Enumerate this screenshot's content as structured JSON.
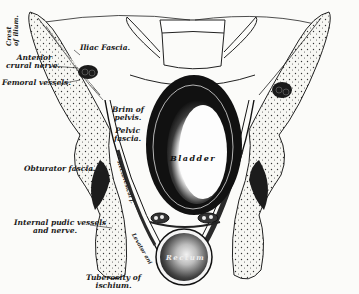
{
  "figure": {
    "colors": {
      "ink": "#1a1a1a",
      "paper": "#fbfbf9",
      "dark_tissue": "#222222",
      "bone_fill": "#f4f4f0"
    }
  },
  "labels": {
    "crest_of_ilium": [
      "Crest",
      "of ilium."
    ],
    "iliac_fascia": "Iliac Fascia.",
    "anterior_crural_nerve": [
      "Anterior",
      "crural nerve."
    ],
    "femoral_vessels": "Femoral vessels.",
    "brim_of_pelvis": [
      "Brim of",
      "pelvis."
    ],
    "pelvic_fascia": [
      "Pelvic",
      "fascia."
    ],
    "obturator_fascia": "Obturator fascia.",
    "internal_pudic": [
      "Internal pudic vessels",
      "and nerve."
    ],
    "tuberosity": [
      "Tuberosity of",
      "ischium."
    ],
    "rectovesical_fascia": "Rectovesical f.",
    "levator_ani": "Levator ani",
    "bladder": "Bladder",
    "rectum": "Rectum"
  }
}
